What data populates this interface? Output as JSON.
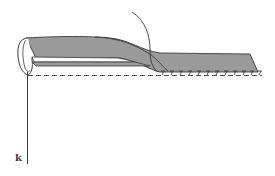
{
  "diagram": {
    "labels": [
      {
        "id": "thread-end",
        "text": "k"
      }
    ],
    "colors": {
      "fabric": "#9a9a9a",
      "outline": "#3a3a3a",
      "background": "#ffffff"
    },
    "stitch_count": 12
  }
}
